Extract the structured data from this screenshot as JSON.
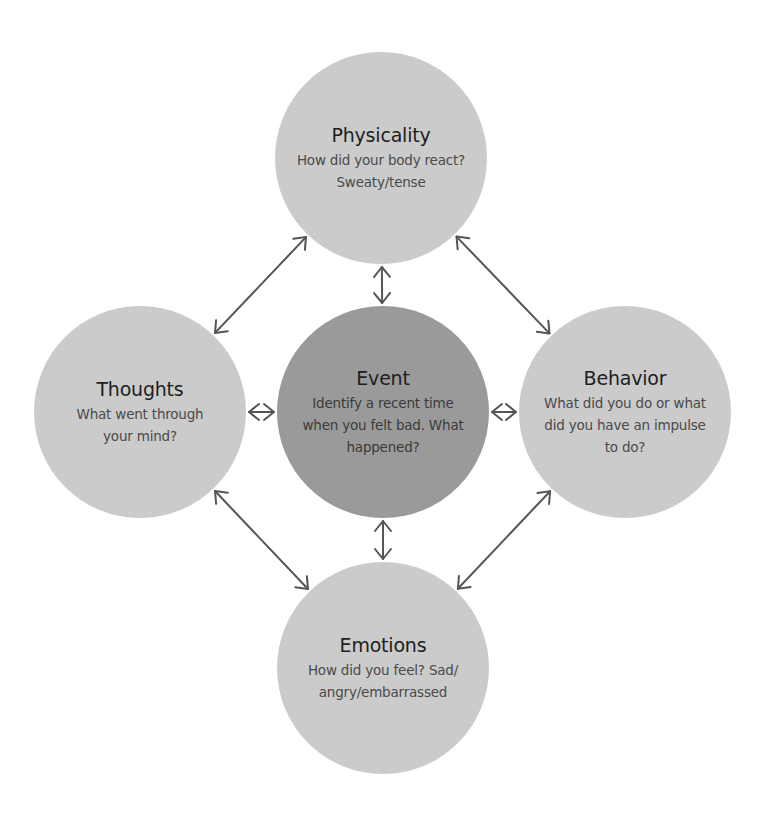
{
  "diagram": {
    "type": "cognitive-behavioral cycle",
    "colors": {
      "outer_node_fill": "#cbcbcb",
      "center_node_fill": "#9a9a9a",
      "arrow": "#555555",
      "title_text": "#1e1e1e",
      "desc_text": "#4a4a4a"
    },
    "nodes": {
      "physicality": {
        "title": "Physicality",
        "desc": "How did your body react?\nSweaty/tense"
      },
      "thoughts": {
        "title": "Thoughts",
        "desc": "What went through\nyour mind?"
      },
      "event": {
        "title": "Event",
        "desc": "Identify a recent time\nwhen you felt bad. What\nhappened?"
      },
      "behavior": {
        "title": "Behavior",
        "desc": "What did you do or what\ndid you have an impulse\nto do?"
      },
      "emotions": {
        "title": "Emotions",
        "desc": "How did you feel? Sad/\nangry/embarrassed"
      }
    },
    "edges": [
      {
        "from": "physicality",
        "to": "event",
        "bidirectional": true
      },
      {
        "from": "thoughts",
        "to": "event",
        "bidirectional": true
      },
      {
        "from": "event",
        "to": "behavior",
        "bidirectional": true
      },
      {
        "from": "event",
        "to": "emotions",
        "bidirectional": true
      },
      {
        "from": "thoughts",
        "to": "physicality",
        "bidirectional": true
      },
      {
        "from": "physicality",
        "to": "behavior",
        "bidirectional": true
      },
      {
        "from": "thoughts",
        "to": "emotions",
        "bidirectional": true
      },
      {
        "from": "emotions",
        "to": "behavior",
        "bidirectional": true
      }
    ]
  }
}
